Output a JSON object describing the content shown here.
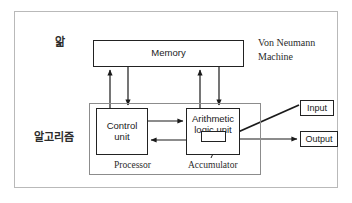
{
  "diagram": {
    "title_note": "Von Neumann Machine",
    "outer_frame": {
      "name": "diagram-border"
    },
    "labels": {
      "knowledge_ko": "앎",
      "algorithm_ko": "알고리즘",
      "von_neumann": "Von Neumann\nMachine",
      "processor": "Processor",
      "accumulator": "Accumulator"
    },
    "nodes": [
      {
        "id": "memory",
        "label": "Memory"
      },
      {
        "id": "control_unit",
        "label": "Control\nunit"
      },
      {
        "id": "alu",
        "label": "Arithmetic\nlogic unit"
      },
      {
        "id": "accumulator",
        "label": ""
      },
      {
        "id": "input",
        "label": "Input"
      },
      {
        "id": "output",
        "label": "Output"
      }
    ],
    "edges": [
      {
        "from": "control_unit",
        "to": "memory",
        "kind": "arrow-up"
      },
      {
        "from": "memory",
        "to": "control_unit",
        "kind": "arrow-down"
      },
      {
        "from": "alu",
        "to": "memory",
        "kind": "arrow-up"
      },
      {
        "from": "memory",
        "to": "alu",
        "kind": "arrow-down"
      },
      {
        "from": "control_unit",
        "to": "alu",
        "kind": "arrow-right"
      },
      {
        "from": "alu",
        "to": "control_unit",
        "kind": "arrow-left"
      },
      {
        "from": "input",
        "to": "accumulator",
        "kind": "arrow-diagonal"
      },
      {
        "from": "accumulator",
        "to": "output",
        "kind": "arrow-right"
      },
      {
        "from": "accumulator_label",
        "to": "accumulator",
        "kind": "leader-line"
      }
    ],
    "colors": {
      "stroke": "#222222",
      "frame": "#b9b9b9",
      "processor_frame": "#8c8c8c",
      "background": "#ffffff",
      "text": "#1a1a1a"
    }
  }
}
